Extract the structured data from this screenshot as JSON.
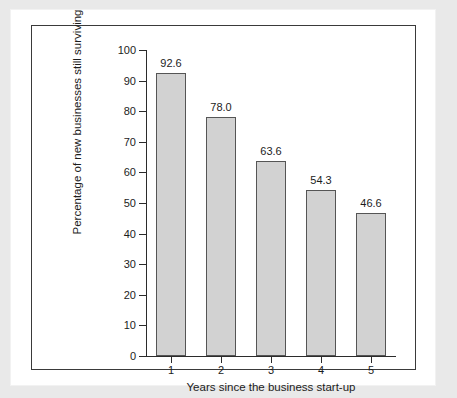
{
  "chart_data": {
    "type": "bar",
    "title": "",
    "xlabel": "Years since the business start-up",
    "ylabel": "Percentage of new businesses still surviving",
    "categories": [
      "1",
      "2",
      "3",
      "4",
      "5"
    ],
    "values": [
      92.6,
      78.0,
      63.6,
      54.3,
      46.6
    ],
    "value_labels": [
      "92.6",
      "78.0",
      "63.6",
      "54.3",
      "46.6"
    ],
    "ylim": [
      0,
      100
    ],
    "ytick_step": 10,
    "ytick_labels": [
      "0",
      "10",
      "20",
      "30",
      "40",
      "50",
      "60",
      "70",
      "80",
      "90",
      "100"
    ],
    "grid": false,
    "legend": null,
    "bar_fill_color": "#d2d2d2",
    "bar_edge_color": "#555555",
    "axis_color": "#2b2b2b",
    "background_color": "#ffffff",
    "page_margin_color": "#e9e9e9"
  }
}
